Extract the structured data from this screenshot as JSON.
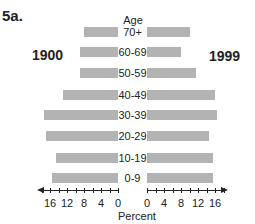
{
  "figure_label": "5a.",
  "left_year": "1900",
  "right_year": "1999",
  "age_title": "Age",
  "x_label": "Percent",
  "left_ticks": [
    "16",
    "12",
    "8",
    "4",
    "0"
  ],
  "right_ticks": [
    "0",
    "4",
    "8",
    "12",
    "16"
  ],
  "chart_data": {
    "type": "bar",
    "orientation": "horizontal",
    "subtype": "population pyramid",
    "title": "5a.",
    "ylabel": "Age",
    "xlabel": "Percent",
    "categories": [
      "70+",
      "60-69",
      "50-59",
      "40-49",
      "30-39",
      "20-29",
      "10-19",
      "0-9"
    ],
    "series": [
      {
        "name": "1900",
        "side": "left",
        "values": [
          8,
          9,
          9,
          13,
          17.5,
          17,
          14.5,
          15.5
        ]
      },
      {
        "name": "1999",
        "side": "right",
        "values": [
          10,
          8,
          11.5,
          16,
          16.5,
          14.5,
          15.5,
          15.5
        ]
      }
    ],
    "xticks": [
      0,
      4,
      8,
      12,
      16
    ],
    "xlim": [
      0,
      20
    ],
    "grid": false,
    "bar_color": "#b3b3b3"
  }
}
